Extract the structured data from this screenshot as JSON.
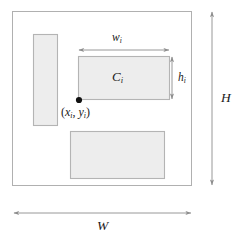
{
  "figure": {
    "background_color": "#ffffff",
    "stroke_color": "#9a9a9a",
    "rect_fill_color": "#ededed",
    "rect_stroke_color": "#aaaaaa",
    "dot_color": "#111111",
    "text_color": "#1a1a1a"
  },
  "outer_box": {
    "name": "bin-outline",
    "x": 12,
    "y": 11,
    "width": 180,
    "height": 175
  },
  "rectangles": [
    {
      "name": "placed-rect-left",
      "label": "",
      "x": 33,
      "y": 34,
      "width": 25,
      "height": 92
    },
    {
      "name": "placed-rect-main",
      "label": "C",
      "label_sub": "i",
      "x": 78,
      "y": 56,
      "width": 92,
      "height": 44
    },
    {
      "name": "placed-rect-bottom",
      "label": "",
      "x": 70,
      "y": 131,
      "width": 95,
      "height": 48
    }
  ],
  "dimension_arrows": [
    {
      "name": "width-arrow-wi",
      "orientation": "horizontal",
      "x1": 78,
      "y1": 50,
      "x2": 169,
      "y2": 50,
      "label": "w",
      "label_sub": "i"
    },
    {
      "name": "height-arrow-hi",
      "orientation": "vertical",
      "x1": 172,
      "y1": 56,
      "x2": 172,
      "y2": 100,
      "label": "h",
      "label_sub": "i"
    },
    {
      "name": "bin-height-arrow-H",
      "orientation": "vertical",
      "x1": 212,
      "y1": 11,
      "x2": 212,
      "y2": 186,
      "label": "H",
      "label_sub": ""
    },
    {
      "name": "bin-width-arrow-W",
      "orientation": "horizontal",
      "x1": 13,
      "y1": 213,
      "x2": 192,
      "y2": 213,
      "label": "W",
      "label_sub": ""
    }
  ],
  "origin_point": {
    "name": "origin-dot",
    "x": 79,
    "y": 100,
    "radius": 3.1,
    "label_open_paren": "(",
    "label_x": "x",
    "label_x_sub": "i",
    "label_comma": ", ",
    "label_y": "y",
    "label_y_sub": "i",
    "label_close_paren": ")"
  },
  "labels": {
    "width_symbol": "w",
    "width_subscript": "i",
    "height_symbol": "h",
    "height_subscript": "i",
    "container_symbol": "C",
    "container_subscript": "i",
    "bin_height_symbol": "H",
    "bin_width_symbol": "W"
  }
}
